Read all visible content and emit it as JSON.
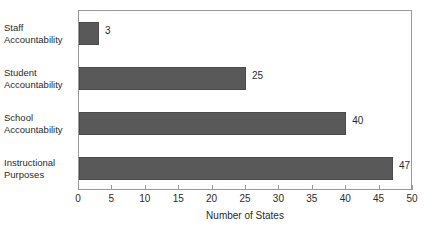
{
  "chart_data": {
    "type": "bar",
    "orientation": "horizontal",
    "title": "",
    "xlabel": "Number of States",
    "ylabel": "",
    "categories": [
      "Staff\nAccountability",
      "Student\nAccountability",
      "School\nAccountability",
      "Instructional\nPurposes"
    ],
    "values": [
      3,
      25,
      40,
      47
    ],
    "data_labels": [
      "3",
      "25",
      "40",
      "47"
    ],
    "xlim": [
      0,
      50
    ],
    "xticks": [
      0,
      5,
      10,
      15,
      20,
      25,
      30,
      35,
      40,
      45,
      50
    ],
    "xtick_labels": [
      "0",
      "5",
      "10",
      "15",
      "20",
      "25",
      "30",
      "35",
      "40",
      "45",
      "50"
    ],
    "grid": false,
    "legend": false,
    "bar_color": "#595959",
    "frame_color": "#9a9a9a",
    "background_color": "#ffffff",
    "text_color": "#2b2b2b"
  }
}
